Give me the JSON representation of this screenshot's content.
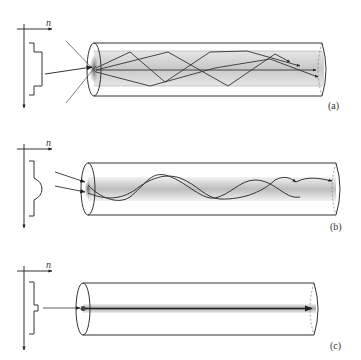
{
  "figure": {
    "panels": [
      {
        "id": "a",
        "label": "(a)",
        "axis_label": "n",
        "index_profile": "step-index (multimode)",
        "rays": "zig-zag reflections"
      },
      {
        "id": "b",
        "label": "(b)",
        "axis_label": "n",
        "index_profile": "graded-index (multimode)",
        "rays": "sinusoidal paths"
      },
      {
        "id": "c",
        "label": "(c)",
        "axis_label": "n",
        "index_profile": "step-index (single-mode)",
        "rays": "straight axial ray"
      }
    ]
  },
  "colors": {
    "line": "#333333",
    "core": "#cfcfcf",
    "core_dark": "#8a8a8a",
    "background": "#ffffff"
  }
}
